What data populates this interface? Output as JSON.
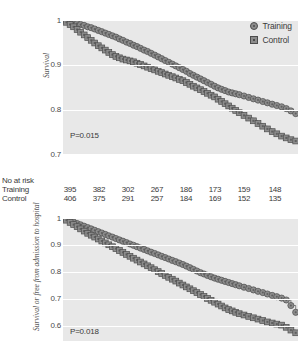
{
  "figure": {
    "legend": {
      "items": [
        {
          "label": "Training",
          "marker": "circle-marker-icon",
          "color": "#8c8c8c"
        },
        {
          "label": "Control",
          "marker": "square-marker-icon",
          "color": "#8c8c8c"
        }
      ]
    },
    "risk_table": {
      "title": "No at risk",
      "rows": [
        {
          "name": "Training",
          "values": [
            395,
            382,
            302,
            267,
            186,
            173,
            159,
            148
          ]
        },
        {
          "name": "Control",
          "values": [
            406,
            375,
            291,
            257,
            184,
            169,
            152,
            135
          ]
        }
      ]
    },
    "colors": {
      "plot_background": "#e8e8e8",
      "gridline": "#ffffff",
      "marker_fill": "#8c8c8c",
      "marker_edge": "#4d4d4d",
      "curve_line": "#5a5a5a",
      "text": "#3a3a3a"
    }
  },
  "chart_data": [
    {
      "type": "line",
      "id": "survival-chart",
      "title": "",
      "xlabel": "",
      "ylabel": "Survival",
      "ylim": [
        0.7,
        1.0
      ],
      "yticks": [
        1,
        0.9,
        0.8,
        0.7
      ],
      "ytick_labels": [
        "1",
        "0.9",
        "0.8",
        "0.7"
      ],
      "xlim": [
        0,
        100
      ],
      "grid": true,
      "legend_position": "top-right",
      "annotations": [
        {
          "text": "P=0.015",
          "x": 8,
          "y": 0.735
        }
      ],
      "series": [
        {
          "name": "Training",
          "marker": "circle",
          "x": [
            0,
            1.5,
            3,
            4.5,
            6,
            7.5,
            9,
            10.5,
            12,
            13.5,
            15,
            16.5,
            18,
            19.5,
            21,
            22.5,
            24,
            25.5,
            27,
            28.5,
            30,
            31.5,
            33,
            34.5,
            36,
            37.5,
            39,
            40.5,
            42,
            43.5,
            45,
            46.5,
            48,
            49.5,
            51,
            52.5,
            54,
            55.5,
            57,
            58.5,
            60,
            61.5,
            63,
            64.5,
            66,
            67.5,
            69,
            70.5,
            72,
            73.5,
            75,
            77,
            79,
            81,
            83,
            85,
            87,
            89,
            91,
            93,
            95,
            97,
            99
          ],
          "values": [
            1,
            0.998,
            0.996,
            0.994,
            0.992,
            0.99,
            0.988,
            0.985,
            0.983,
            0.98,
            0.977,
            0.974,
            0.971,
            0.968,
            0.965,
            0.962,
            0.958,
            0.955,
            0.951,
            0.948,
            0.944,
            0.941,
            0.937,
            0.933,
            0.93,
            0.926,
            0.922,
            0.918,
            0.914,
            0.91,
            0.906,
            0.902,
            0.898,
            0.894,
            0.89,
            0.886,
            0.881,
            0.877,
            0.873,
            0.869,
            0.865,
            0.861,
            0.857,
            0.853,
            0.849,
            0.846,
            0.843,
            0.84,
            0.838,
            0.836,
            0.834,
            0.831,
            0.828,
            0.825,
            0.822,
            0.819,
            0.816,
            0.813,
            0.81,
            0.807,
            0.803,
            0.798,
            0.792
          ]
        },
        {
          "name": "Control",
          "marker": "square",
          "x": [
            0,
            1.5,
            3,
            4.5,
            6,
            7.5,
            9,
            10.5,
            12,
            13.5,
            15,
            16.5,
            18,
            19.5,
            21,
            22.5,
            24,
            25.5,
            27,
            28.5,
            30,
            31.5,
            33,
            34.5,
            36,
            37.5,
            39,
            40.5,
            42,
            43.5,
            45,
            46.5,
            48,
            49.5,
            51,
            52.5,
            54,
            55.5,
            57,
            58.5,
            60,
            61.5,
            63,
            64.5,
            66,
            67.5,
            69,
            70.5,
            72,
            73.5,
            75,
            77,
            79,
            81,
            83,
            85,
            87,
            89,
            91,
            93,
            95,
            97,
            99
          ],
          "values": [
            1,
            0.995,
            0.99,
            0.985,
            0.979,
            0.973,
            0.967,
            0.961,
            0.955,
            0.949,
            0.943,
            0.938,
            0.933,
            0.928,
            0.923,
            0.919,
            0.916,
            0.913,
            0.911,
            0.909,
            0.907,
            0.904,
            0.901,
            0.898,
            0.895,
            0.892,
            0.889,
            0.886,
            0.883,
            0.88,
            0.877,
            0.874,
            0.871,
            0.868,
            0.865,
            0.861,
            0.857,
            0.853,
            0.849,
            0.845,
            0.841,
            0.837,
            0.833,
            0.829,
            0.824,
            0.819,
            0.814,
            0.809,
            0.804,
            0.799,
            0.794,
            0.788,
            0.782,
            0.776,
            0.77,
            0.764,
            0.758,
            0.752,
            0.747,
            0.742,
            0.738,
            0.734,
            0.731
          ]
        }
      ]
    },
    {
      "type": "line",
      "id": "survival-free-admission-chart",
      "title": "",
      "xlabel": "",
      "ylabel": "Survival or free from admission to hospital",
      "ylim": [
        0.55,
        1.0
      ],
      "yticks": [
        1,
        0.9,
        0.8,
        0.7,
        0.6
      ],
      "ytick_labels": [
        "1",
        "0.9",
        "0.8",
        "0.7",
        "0.6"
      ],
      "xlim": [
        0,
        100
      ],
      "grid": true,
      "annotations": [
        {
          "text": "P=0.018",
          "x": 8,
          "y": 0.575
        }
      ],
      "series": [
        {
          "name": "Training",
          "marker": "circle",
          "x": [
            0,
            1.5,
            3,
            4.5,
            6,
            7.5,
            9,
            10.5,
            12,
            13.5,
            15,
            16.5,
            18,
            19.5,
            21,
            22.5,
            24,
            25.5,
            27,
            28.5,
            30,
            31.5,
            33,
            34.5,
            36,
            37.5,
            39,
            40.5,
            42,
            43.5,
            45,
            46.5,
            48,
            49.5,
            51,
            52.5,
            54,
            55.5,
            57,
            58.5,
            60,
            61.5,
            63,
            64.5,
            66,
            67.5,
            69,
            70.5,
            72,
            73.5,
            75,
            77,
            79,
            81,
            83,
            85,
            87,
            89,
            91,
            93,
            95,
            97,
            99
          ],
          "values": [
            1,
            0.995,
            0.99,
            0.985,
            0.98,
            0.975,
            0.97,
            0.965,
            0.96,
            0.955,
            0.95,
            0.945,
            0.94,
            0.935,
            0.93,
            0.925,
            0.92,
            0.915,
            0.91,
            0.905,
            0.9,
            0.895,
            0.89,
            0.885,
            0.88,
            0.875,
            0.87,
            0.865,
            0.86,
            0.855,
            0.85,
            0.845,
            0.84,
            0.835,
            0.83,
            0.824,
            0.818,
            0.812,
            0.806,
            0.8,
            0.795,
            0.79,
            0.785,
            0.78,
            0.776,
            0.772,
            0.768,
            0.764,
            0.76,
            0.756,
            0.752,
            0.747,
            0.742,
            0.737,
            0.732,
            0.727,
            0.722,
            0.717,
            0.712,
            0.707,
            0.7,
            0.68,
            0.655
          ]
        },
        {
          "name": "Control",
          "marker": "square",
          "x": [
            0,
            1.5,
            3,
            4.5,
            6,
            7.5,
            9,
            10.5,
            12,
            13.5,
            15,
            16.5,
            18,
            19.5,
            21,
            22.5,
            24,
            25.5,
            27,
            28.5,
            30,
            31.5,
            33,
            34.5,
            36,
            37.5,
            39,
            40.5,
            42,
            43.5,
            45,
            46.5,
            48,
            49.5,
            51,
            52.5,
            54,
            55.5,
            57,
            58.5,
            60,
            61.5,
            63,
            64.5,
            66,
            67.5,
            69,
            70.5,
            72,
            73.5,
            75,
            77,
            79,
            81,
            83,
            85,
            87,
            89,
            91,
            93,
            95,
            97,
            99
          ],
          "values": [
            1,
            0.992,
            0.984,
            0.976,
            0.968,
            0.96,
            0.952,
            0.944,
            0.937,
            0.93,
            0.923,
            0.916,
            0.909,
            0.902,
            0.895,
            0.888,
            0.881,
            0.874,
            0.867,
            0.86,
            0.853,
            0.846,
            0.839,
            0.832,
            0.825,
            0.818,
            0.811,
            0.804,
            0.797,
            0.79,
            0.783,
            0.776,
            0.769,
            0.762,
            0.755,
            0.748,
            0.741,
            0.734,
            0.727,
            0.72,
            0.713,
            0.706,
            0.699,
            0.692,
            0.685,
            0.678,
            0.671,
            0.665,
            0.66,
            0.655,
            0.65,
            0.645,
            0.64,
            0.635,
            0.63,
            0.625,
            0.62,
            0.616,
            0.612,
            0.608,
            0.6,
            0.59,
            0.58
          ]
        }
      ]
    }
  ]
}
